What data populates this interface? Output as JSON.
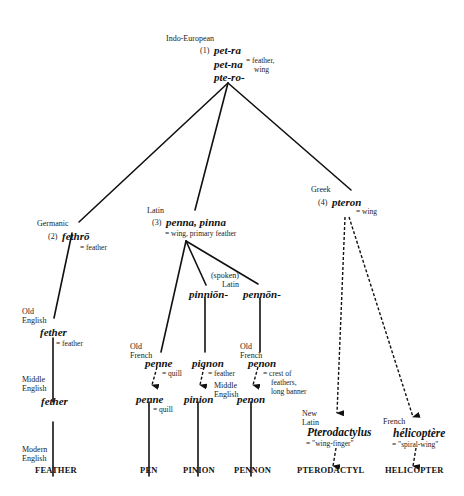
{
  "diagram": {
    "type": "etymology-tree",
    "root": {
      "language": "Indo-European",
      "number": "(1)",
      "forms": [
        "pet-ra",
        "pet-na",
        "pte-ro-"
      ],
      "gloss_line1": "= feather,",
      "gloss_line2": "wing"
    },
    "germanic": {
      "language": "Germanic",
      "number": "(2)",
      "form": "fethrō",
      "gloss": "= feather",
      "old_english": {
        "language_line1": "Old",
        "language_line2": "English",
        "form": "fether",
        "gloss": "= feather"
      },
      "middle_english": {
        "language_line1": "Middle",
        "language_line2": "English",
        "form": "fether"
      },
      "modern_english": {
        "language_line1": "Modern",
        "language_line2": "English",
        "word": "FEATHER"
      }
    },
    "latin": {
      "language": "Latin",
      "number": "(3)",
      "form": "penna, pinna",
      "gloss": "= wing, primary feather",
      "spoken_latin": {
        "line1": "(spoken)",
        "line2": "Latin"
      },
      "pen_branch": {
        "old_french_line1": "Old",
        "old_french_line2": "French",
        "of_form": "penne",
        "of_gloss": "= quill",
        "me_form": "penne",
        "me_gloss": "= quill",
        "word": "PEN"
      },
      "pinion_branch": {
        "vl_form": "pinniōn-",
        "of_form": "pignon",
        "of_gloss": "= feather",
        "me_line1": "Middle",
        "me_line2": "English",
        "me_form": "pinion",
        "word": "PINION"
      },
      "pennon_branch": {
        "vl_form": "pennōn-",
        "old_french_line1": "Old",
        "old_french_line2": "French",
        "of_form": "penon",
        "of_gloss_line1": "= crest of",
        "of_gloss_line2": "feathers,",
        "of_gloss_line3": "long banner",
        "me_form": "penon",
        "word": "PENNON"
      }
    },
    "greek": {
      "language": "Greek",
      "number": "(4)",
      "form": "pteron",
      "gloss": "= wing",
      "pterodactyl_branch": {
        "language_line1": "New",
        "language_line2": "Latin",
        "form": "Pterodactylus",
        "gloss": "= \"wing-finger\"",
        "word": "PTERODACTYL"
      },
      "helicopter_branch": {
        "language": "French",
        "form": "hélicoptère",
        "gloss": "= \"spiral-wing\"",
        "word": "HELICOPTER"
      }
    },
    "legend": {
      "solid_line": "inherited descent",
      "dashed_line": "learned borrowing / coinage"
    },
    "colors": {
      "line": "#111111",
      "background": "#ffffff"
    }
  }
}
